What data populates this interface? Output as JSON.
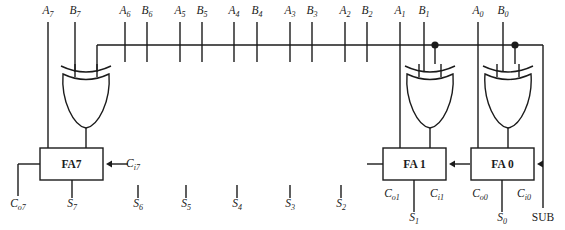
{
  "figure": {
    "background_color": "#ffffff",
    "line_color": "#1b1b1b"
  },
  "top_inputs": [
    {
      "name": "A7",
      "base": "A",
      "sub": "7",
      "x": 48,
      "label_x": 48,
      "label_y": 14
    },
    {
      "name": "B7",
      "base": "B",
      "sub": "7",
      "x": 75,
      "label_x": 75,
      "label_y": 14
    },
    {
      "name": "A6",
      "base": "A",
      "sub": "6",
      "x": 125,
      "label_x": 125,
      "label_y": 14
    },
    {
      "name": "B6",
      "base": "B",
      "sub": "6",
      "x": 147,
      "label_x": 147,
      "label_y": 14
    },
    {
      "name": "A5",
      "base": "A",
      "sub": "5",
      "x": 180,
      "label_x": 180,
      "label_y": 14
    },
    {
      "name": "B5",
      "base": "B",
      "sub": "5",
      "x": 202,
      "label_x": 202,
      "label_y": 14
    },
    {
      "name": "A4",
      "base": "A",
      "sub": "4",
      "x": 234,
      "label_x": 234,
      "label_y": 14
    },
    {
      "name": "B4",
      "base": "B",
      "sub": "4",
      "x": 257,
      "label_x": 257,
      "label_y": 14
    },
    {
      "name": "A3",
      "base": "A",
      "sub": "3",
      "x": 290,
      "label_x": 290,
      "label_y": 14
    },
    {
      "name": "B3",
      "base": "B",
      "sub": "3",
      "x": 312,
      "label_x": 312,
      "label_y": 14
    },
    {
      "name": "A2",
      "base": "A",
      "sub": "2",
      "x": 345,
      "label_x": 345,
      "label_y": 14
    },
    {
      "name": "B2",
      "base": "B",
      "sub": "2",
      "x": 367,
      "label_x": 367,
      "label_y": 14
    },
    {
      "name": "A1",
      "base": "A",
      "sub": "1",
      "x": 400,
      "label_x": 400,
      "label_y": 14
    },
    {
      "name": "B1",
      "base": "B",
      "sub": "1",
      "x": 424,
      "label_x": 424,
      "label_y": 14
    },
    {
      "name": "A0",
      "base": "A",
      "sub": "0",
      "x": 478,
      "label_x": 478,
      "label_y": 14
    },
    {
      "name": "B0",
      "base": "B",
      "sub": "0",
      "x": 503,
      "label_x": 503,
      "label_y": 14
    }
  ],
  "bus": {
    "y": 45,
    "left_x": 97,
    "right_x": 543,
    "drop_x": 97,
    "drop_to_y": 72,
    "right_drop_to_y": 178,
    "junction_dots": [
      {
        "x": 435,
        "y": 45
      },
      {
        "x": 515,
        "y": 45
      }
    ]
  },
  "xor_gates": [
    {
      "name": "xor-bit-7",
      "cx": 86,
      "top_y": 68,
      "bottom_y": 128,
      "out_to_y": 148
    },
    {
      "name": "xor-bit-1",
      "cx": 430,
      "top_y": 68,
      "bottom_y": 128,
      "out_to_y": 148
    },
    {
      "name": "xor-bit-0",
      "cx": 508,
      "top_y": 68,
      "bottom_y": 128,
      "out_to_y": 148
    }
  ],
  "adders": [
    {
      "name": "FA7",
      "label": "FA7",
      "x": 40,
      "y": 148,
      "width": 63,
      "height": 32,
      "carry_in_label": {
        "base": "C",
        "sub": "i7",
        "x": 133,
        "y": 167
      },
      "carry_in_arrow": {
        "from_x": 128,
        "to_x": 106,
        "y": 164
      },
      "carry_out_label": {
        "base": "C",
        "sub": "o7",
        "x": 18,
        "y": 207
      },
      "sum_label": {
        "base": "S",
        "sub": "7",
        "x": 72,
        "y": 207
      }
    },
    {
      "name": "FA 1",
      "label": "FA 1",
      "x": 383,
      "y": 148,
      "width": 63,
      "height": 32,
      "carry_in_label": {
        "base": "C",
        "sub": "i1",
        "x": 437,
        "y": 197
      },
      "carry_in_arrow": {
        "from_x": 470,
        "to_x": 449,
        "y": 164
      },
      "carry_out_label": {
        "base": "C",
        "sub": "o1",
        "x": 392,
        "y": 197
      },
      "sum_label": {
        "base": "S",
        "sub": "1",
        "x": 414,
        "y": 221
      }
    },
    {
      "name": "FA 0",
      "label": "FA 0",
      "x": 471,
      "y": 148,
      "width": 63,
      "height": 32,
      "carry_in_label": {
        "base": "C",
        "sub": "i0",
        "x": 524,
        "y": 197
      },
      "carry_in_arrow": {
        "from_x": 543,
        "to_x": 537,
        "y": 164
      },
      "carry_out_label": {
        "base": "C",
        "sub": "o0",
        "x": 480,
        "y": 197
      },
      "sum_label": {
        "base": "S",
        "sub": "0",
        "x": 502,
        "y": 221
      }
    }
  ],
  "sum_stubs": [
    {
      "name": "S6",
      "base": "S",
      "sub": "6",
      "x": 138,
      "label_y": 207,
      "stub_top": 185,
      "stub_bottom": 198
    },
    {
      "name": "S5",
      "base": "S",
      "sub": "5",
      "x": 186,
      "label_y": 207,
      "stub_top": 185,
      "stub_bottom": 198
    },
    {
      "name": "S4",
      "base": "S",
      "sub": "4",
      "x": 237,
      "label_y": 207,
      "stub_top": 185,
      "stub_bottom": 198
    },
    {
      "name": "S3",
      "base": "S",
      "sub": "3",
      "x": 290,
      "label_y": 207,
      "stub_top": 185,
      "stub_bottom": 198
    },
    {
      "name": "S2",
      "base": "S",
      "sub": "2",
      "x": 341,
      "label_y": 207,
      "stub_top": 185,
      "stub_bottom": 198
    }
  ],
  "sub_control": {
    "label": "SUB",
    "x": 543,
    "label_y": 221,
    "line_top_y": 45,
    "line_bottom_y": 208
  }
}
